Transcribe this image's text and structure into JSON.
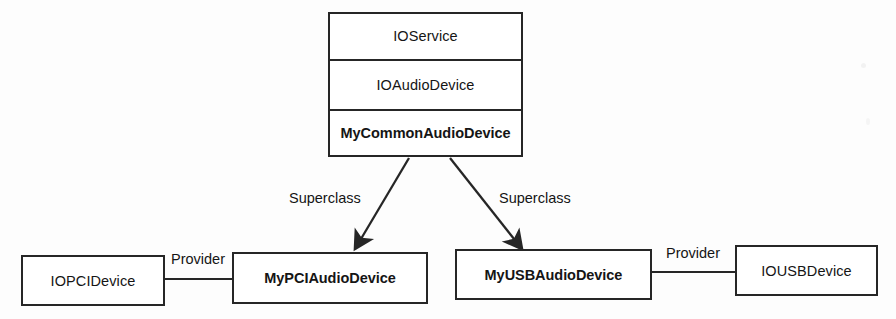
{
  "diagram": {
    "type": "class-hierarchy",
    "nodes": {
      "class_stack": {
        "name": "inheritance-stack",
        "rows": [
          {
            "label": "IOService",
            "bold": false
          },
          {
            "label": "IOAudioDevice",
            "bold": false
          },
          {
            "label": "MyCommonAudioDevice",
            "bold": true
          }
        ]
      },
      "io_pci_device": {
        "label": "IOPCIDevice",
        "bold": false
      },
      "my_pci_audio_device": {
        "label": "MyPCIAudioDevice",
        "bold": true
      },
      "my_usb_audio_device": {
        "label": "MyUSBAudioDevice",
        "bold": true
      },
      "io_usb_device": {
        "label": "IOUSBDevice",
        "bold": false
      }
    },
    "edges": {
      "superclass_left": {
        "label": "Superclass",
        "from": "MyCommonAudioDevice",
        "to": "MyPCIAudioDevice",
        "style": "arrow"
      },
      "superclass_right": {
        "label": "Superclass",
        "from": "MyCommonAudioDevice",
        "to": "MyUSBAudioDevice",
        "style": "arrow"
      },
      "provider_left": {
        "label": "Provider",
        "from": "IOPCIDevice",
        "to": "MyPCIAudioDevice",
        "style": "line"
      },
      "provider_right": {
        "label": "Provider",
        "from": "MyUSBAudioDevice",
        "to": "IOUSBDevice",
        "style": "line"
      }
    },
    "colors": {
      "stroke": "#262626",
      "fill": "#ffffff",
      "text": "#151515",
      "background": "#fdfdfd"
    }
  }
}
